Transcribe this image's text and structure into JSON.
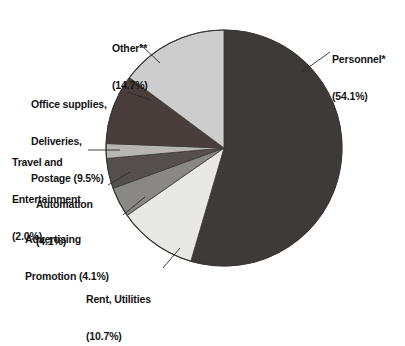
{
  "chart_data": {
    "type": "pie",
    "title": "",
    "subtitle": "",
    "xlabel": "",
    "ylabel": "",
    "legend_position": "callout-labels",
    "grid": false,
    "start_angle_deg": 0,
    "direction": "clockwise",
    "units": "percent",
    "categories": [
      "Personnel*",
      "Rent, Utilities",
      "Advertising Promotion",
      "Automation",
      "Travel and Entertainment",
      "Office supplies, Deliveries, Postage",
      "Other**"
    ],
    "values": [
      54.1,
      10.7,
      4.1,
      4.1,
      2.0,
      9.5,
      14.7
    ],
    "colors": [
      "#3e3a38",
      "#e8e8e6",
      "#8a8885",
      "#55504d",
      "#b8b6b2",
      "#4a3e3c",
      "#cdcdcd"
    ],
    "slices": [
      {
        "name": "Personnel*",
        "label_lines": [
          "Personnel*",
          "(54.1%)"
        ],
        "value": 54.1,
        "percent_text": "(54.1%)",
        "color": "#3e3a38"
      },
      {
        "name": "Rent, Utilities",
        "label_lines": [
          "Rent, Utilities",
          "(10.7%)"
        ],
        "value": 10.7,
        "percent_text": "(10.7%)",
        "color": "#e8e8e6"
      },
      {
        "name": "Advertising Promotion",
        "label_lines": [
          "Advertising",
          "Promotion (4.1%)"
        ],
        "value": 4.1,
        "percent_text": "(4.1%)",
        "color": "#8a8885"
      },
      {
        "name": "Automation",
        "label_lines": [
          "Automation",
          "(4.1%)"
        ],
        "value": 4.1,
        "percent_text": "(4.1%)",
        "color": "#55504d"
      },
      {
        "name": "Travel and Entertainment",
        "label_lines": [
          "Travel and",
          "Entertainment",
          "(2.0%)"
        ],
        "value": 2.0,
        "percent_text": "(2.0%)",
        "color": "#b8b6b2"
      },
      {
        "name": "Office supplies, Deliveries, Postage",
        "label_lines": [
          "Office supplies,",
          "Deliveries,",
          "Postage (9.5%)"
        ],
        "value": 9.5,
        "percent_text": "(9.5%)",
        "color": "#4a3e3c"
      },
      {
        "name": "Other**",
        "label_lines": [
          "Other**",
          "(14.7%)"
        ],
        "value": 14.7,
        "percent_text": "(14.7%)",
        "color": "#cdcdcd"
      }
    ]
  },
  "labels": {
    "personnel": {
      "line1": "Personnel*",
      "line2": "(54.1%)"
    },
    "other": {
      "line1": "Other**",
      "line2": "(14.7%)"
    },
    "office": {
      "line1": "Office supplies,",
      "line2": "Deliveries,",
      "line3": "Postage (9.5%)"
    },
    "travel": {
      "line1": "Travel and",
      "line2": "Entertainment",
      "line3": "(2.0%)"
    },
    "automation": {
      "line1": "Automation",
      "line2": "(4.1%)"
    },
    "advertising": {
      "line1": "Advertising",
      "line2": "Promotion (4.1%)"
    },
    "rent": {
      "line1": "Rent, Utilities",
      "line2": "(10.7%)"
    }
  },
  "style": {
    "background": "#ffffff",
    "text_color": "#141414",
    "outline_color": "#3a3634",
    "leader_color": "#2b2b2b"
  }
}
